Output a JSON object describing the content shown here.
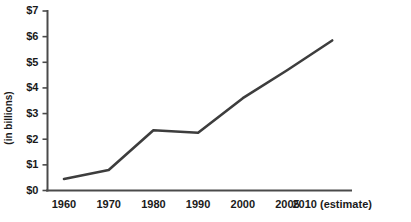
{
  "chart_data": {
    "type": "line",
    "title": "",
    "subtitle": "",
    "xlabel": "",
    "ylabel": "(in billions)",
    "categories": [
      "1960",
      "1970",
      "1980",
      "1990",
      "2000",
      "2005",
      "2010 (estimate)"
    ],
    "x_tick_labels": [
      "1960",
      "1970",
      "1980",
      "1990",
      "2000",
      "2005",
      "2010 (estimate)"
    ],
    "y_tick_labels": [
      "$0",
      "$1",
      "$2",
      "$3",
      "$4",
      "$5",
      "$6",
      "$7"
    ],
    "y_tick_values": [
      0,
      1,
      2,
      3,
      4,
      5,
      6,
      7
    ],
    "ylim": [
      0,
      7
    ],
    "grid": false,
    "legend": false,
    "legend_position": "none",
    "series": [
      {
        "name": "value",
        "values": [
          0.45,
          0.8,
          2.35,
          2.25,
          3.6,
          4.7,
          5.85
        ]
      }
    ],
    "line_color": "#3d3d3d",
    "axis_color": "#4a4a4a",
    "background_color": "#ffffff",
    "annotations": []
  }
}
